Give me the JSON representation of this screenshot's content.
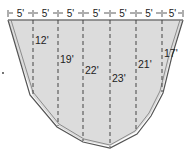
{
  "diagram": {
    "section_width_label": "5'",
    "section_widths": [
      "5'",
      "5'",
      "5'",
      "5'",
      "5'",
      "5'",
      "5'"
    ],
    "depths": [
      "12'",
      "19'",
      "22'",
      "23'",
      "21'",
      "17'"
    ],
    "colors": {
      "fill": "#dcdcdc",
      "outline": "#555555",
      "dashed": "#444444",
      "text": "#222222"
    }
  }
}
